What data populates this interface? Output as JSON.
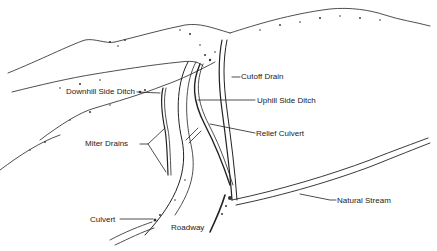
{
  "diagram": {
    "colors": {
      "ink": "#222222",
      "background": "#ffffff"
    },
    "labels": {
      "downhill_side_ditch": "Downhill Side Ditch",
      "cutoff_drain": "Cutoff Drain",
      "uphill_side_ditch": "Uphill Side Ditch",
      "relief_culvert": "Relief Culvert",
      "miter_drains": "Miter Drains",
      "natural_stream": "Natural Stream",
      "culvert": "Culvert",
      "roadway": "Roadway"
    }
  }
}
